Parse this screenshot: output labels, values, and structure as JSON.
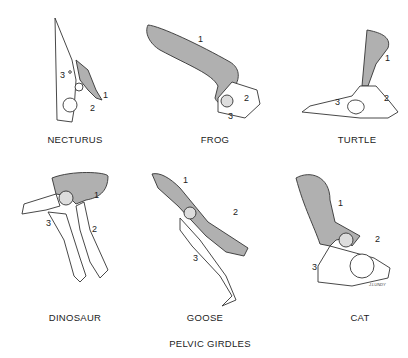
{
  "title": "PELVIC GIRDLES",
  "panels": [
    {
      "name": "NECTURUS",
      "callouts": [
        "1",
        "2",
        "3"
      ]
    },
    {
      "name": "FROG",
      "callouts": [
        "1",
        "2",
        "3"
      ]
    },
    {
      "name": "TURTLE",
      "callouts": [
        "1",
        "2",
        "3"
      ]
    },
    {
      "name": "DINOSAUR",
      "callouts": [
        "1",
        "2",
        "3"
      ]
    },
    {
      "name": "GOOSE",
      "callouts": [
        "1",
        "2",
        "3"
      ]
    },
    {
      "name": "CAT",
      "callouts": [
        "1",
        "2",
        "3"
      ]
    }
  ],
  "signature": "J.LUNDY",
  "colors": {
    "ilium_fill": "#b0b0b0",
    "outline": "#333333",
    "background": "#ffffff"
  }
}
